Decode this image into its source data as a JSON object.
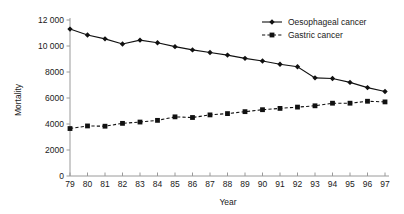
{
  "chart_data": {
    "type": "line",
    "title": "",
    "xlabel": "Year",
    "ylabel": "Mortality",
    "x": [
      "79",
      "80",
      "81",
      "82",
      "83",
      "84",
      "85",
      "86",
      "87",
      "88",
      "89",
      "90",
      "91",
      "92",
      "93",
      "94",
      "95",
      "96",
      "97"
    ],
    "categories": [
      "79",
      "80",
      "81",
      "82",
      "83",
      "84",
      "85",
      "86",
      "87",
      "88",
      "89",
      "90",
      "91",
      "92",
      "93",
      "94",
      "95",
      "96",
      "97"
    ],
    "xlim": [
      0,
      18
    ],
    "ylim": [
      0,
      12000
    ],
    "yticks": [
      0,
      2000,
      4000,
      6000,
      8000,
      10000,
      12000
    ],
    "ytick_labels": [
      "0",
      "2000",
      "4000",
      "6000",
      "8000",
      "10 000",
      "12 000"
    ],
    "grid": false,
    "legend_position": "top-right",
    "series": [
      {
        "name": "Oesophageal cancer",
        "linestyle": "solid",
        "marker": "diamond",
        "color": "#111111",
        "values": [
          11300,
          10850,
          10550,
          10150,
          10450,
          10250,
          9950,
          9700,
          9500,
          9300,
          9050,
          8850,
          8600,
          8400,
          7550,
          7500,
          7200,
          6800,
          6500
        ]
      },
      {
        "name": "Gastric cancer",
        "linestyle": "dashed",
        "marker": "square",
        "color": "#111111",
        "values": [
          3650,
          3850,
          3830,
          4050,
          4150,
          4280,
          4550,
          4500,
          4700,
          4800,
          4950,
          5100,
          5200,
          5300,
          5400,
          5600,
          5600,
          5750,
          5700
        ]
      }
    ]
  },
  "legend": {
    "items": [
      {
        "label": "Oesophageal cancer"
      },
      {
        "label": "Gastric cancer"
      }
    ]
  },
  "axes": {
    "y_title": "Mortality",
    "x_title": "Year"
  }
}
